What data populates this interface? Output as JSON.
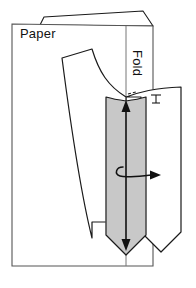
{
  "figure": {
    "type": "instructional-diagram",
    "background_color": "#ffffff",
    "outline_color": "#1a1a1a",
    "shaded_fill_color": "#c8c8c8"
  },
  "labels": {
    "paper": "Paper",
    "fold": "Fold"
  },
  "annotations": {
    "grainline_arrow": {
      "name": "double-headed-grainline-arrow",
      "direction": "vertical-both-ways"
    },
    "flip_arrow": {
      "name": "curl-flip-arrow",
      "direction": "right"
    },
    "notch_mark": {
      "name": "notch-tick-mark"
    }
  },
  "shapes": {
    "paper_sheet": "rectangular sheet",
    "fold_flap": "folded-back top flap",
    "fold_line": "vertical fold crease",
    "pattern_piece_left": "curved pattern piece",
    "pattern_piece_right": "mirrored pattern piece",
    "shaded_strip": "shaded overlap strip with pointed bottom"
  }
}
